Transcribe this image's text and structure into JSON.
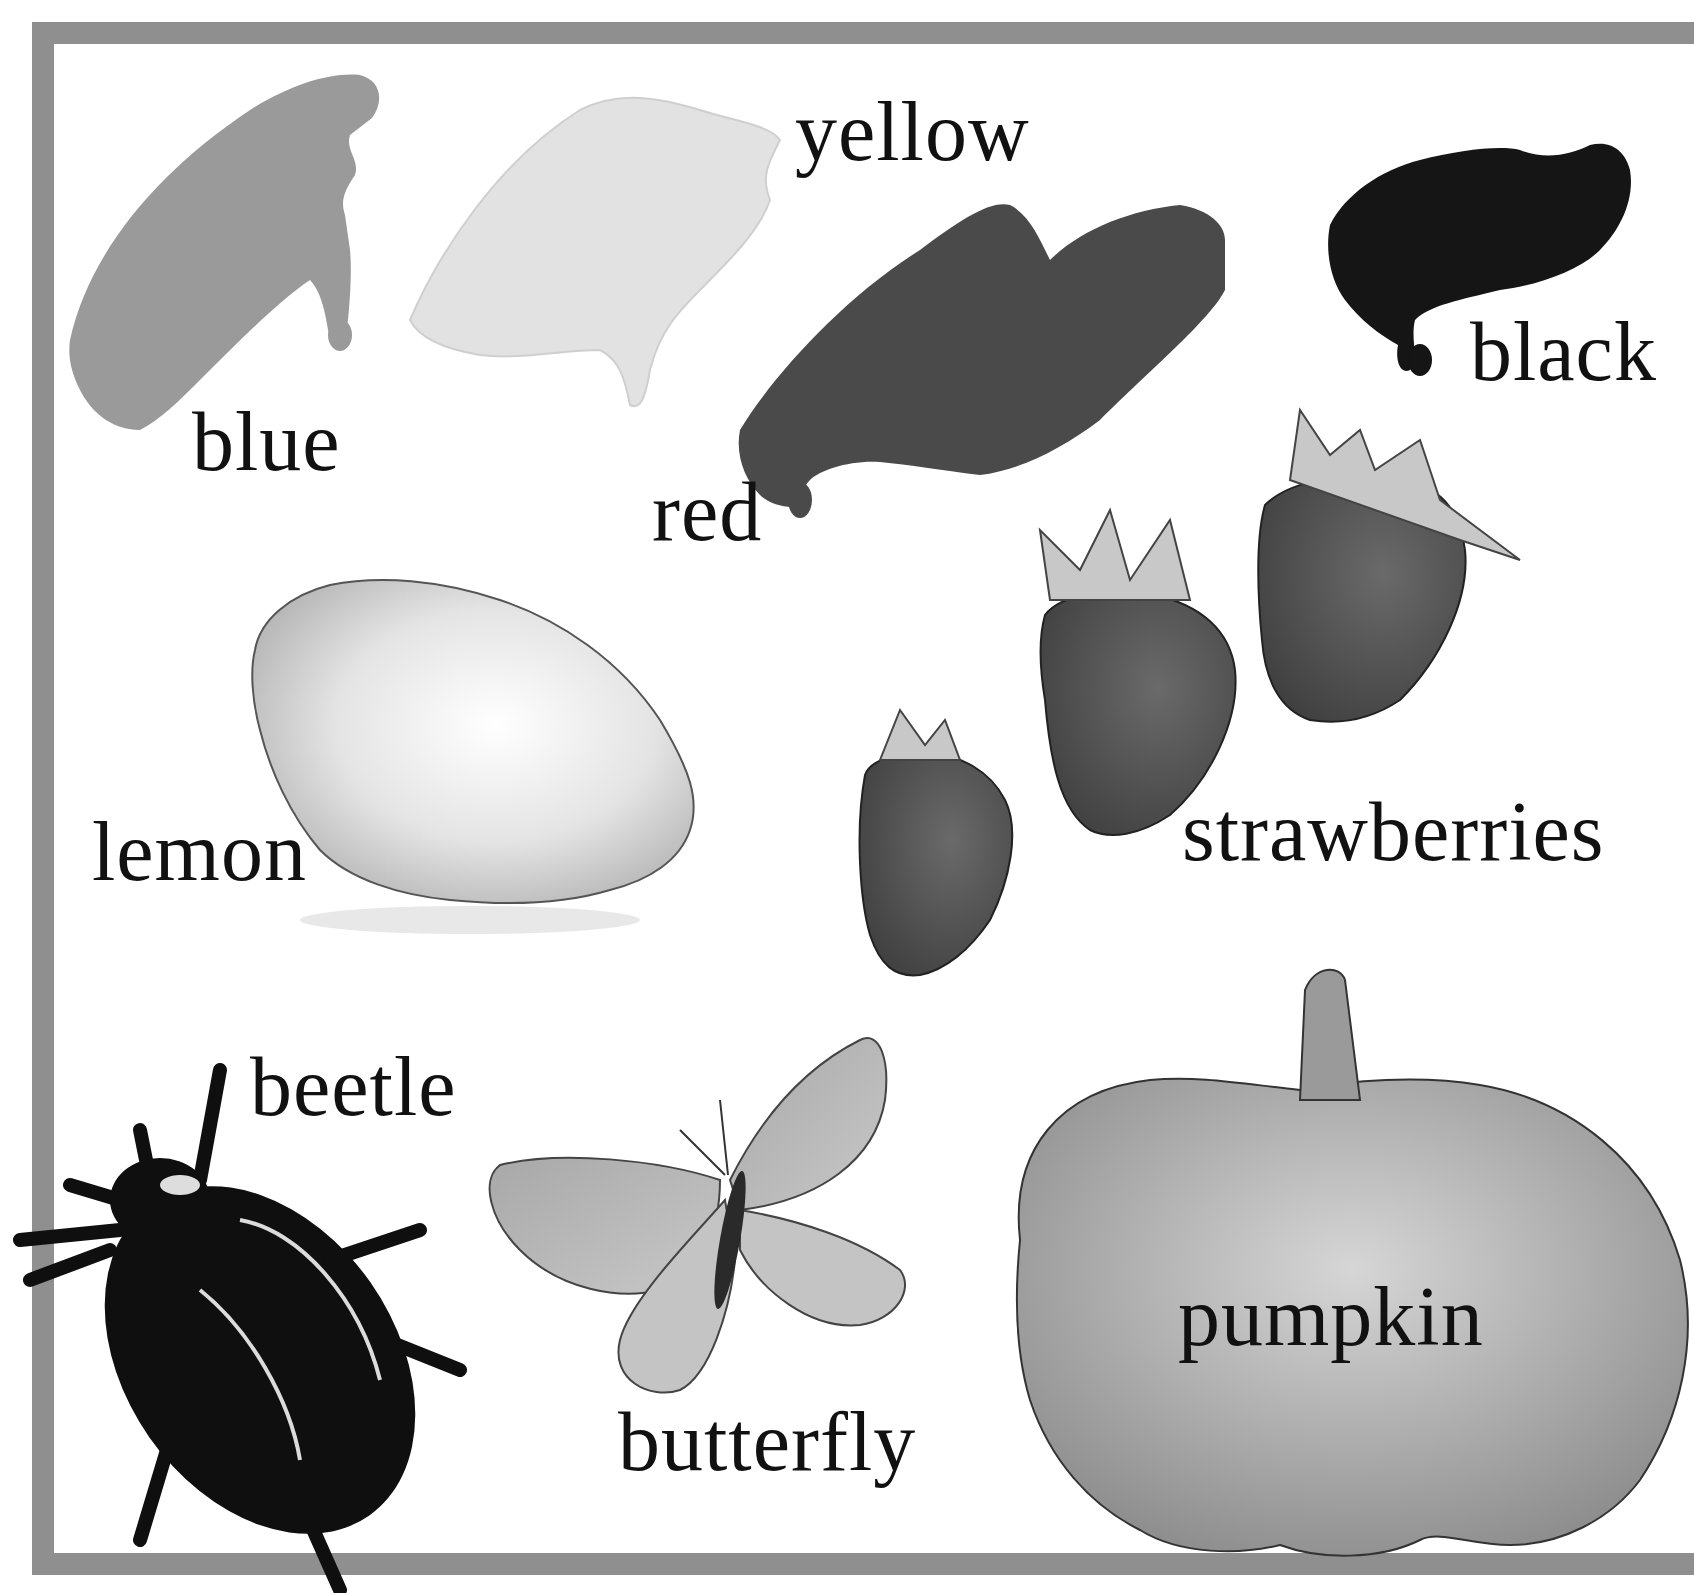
{
  "page": {
    "type": "picture-vocabulary",
    "colors": {
      "frame": "#8f8f8f",
      "text": "#111111",
      "background": "#ffffff"
    }
  },
  "labels": {
    "blue": "blue",
    "yellow": "yellow",
    "red": "red",
    "black": "black",
    "lemon": "lemon",
    "strawberries": "strawberries",
    "beetle": "beetle",
    "butterfly": "butterfly",
    "pumpkin": "pumpkin"
  },
  "items": [
    {
      "name": "blue",
      "kind": "paint-swatch",
      "tone": "#9a9a9a"
    },
    {
      "name": "yellow",
      "kind": "paint-swatch",
      "tone": "#e2e2e2"
    },
    {
      "name": "red",
      "kind": "paint-swatch",
      "tone": "#4a4a4a"
    },
    {
      "name": "black",
      "kind": "paint-swatch",
      "tone": "#151515"
    },
    {
      "name": "lemon",
      "kind": "illustration"
    },
    {
      "name": "strawberries",
      "kind": "illustration",
      "count": 3
    },
    {
      "name": "beetle",
      "kind": "illustration"
    },
    {
      "name": "butterfly",
      "kind": "illustration"
    },
    {
      "name": "pumpkin",
      "kind": "illustration"
    }
  ]
}
